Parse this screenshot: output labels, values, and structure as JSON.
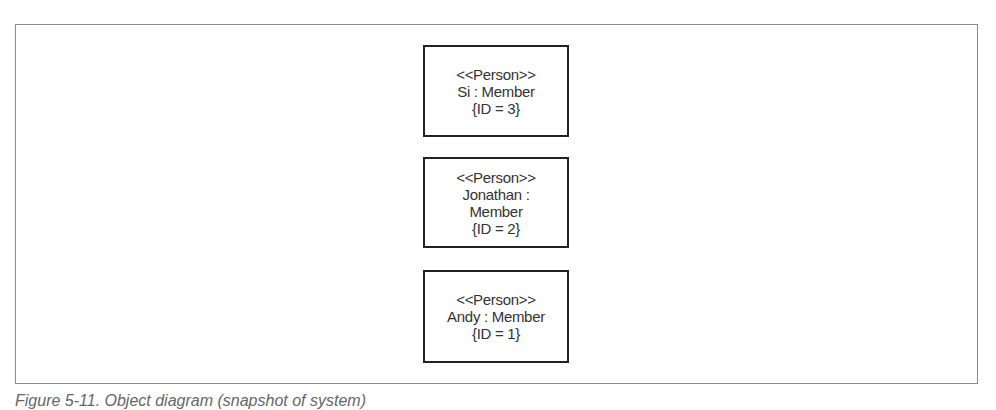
{
  "diagram": {
    "objects": [
      {
        "stereotype": "<<Person>>",
        "lines": [
          "Si : Member"
        ],
        "constraint": "{ID = 3}"
      },
      {
        "stereotype": "<<Person>>",
        "lines": [
          "Jonathan :",
          "Member"
        ],
        "constraint": "{ID = 2}"
      },
      {
        "stereotype": "<<Person>>",
        "lines": [
          "Andy : Member"
        ],
        "constraint": "{ID = 1}"
      }
    ]
  },
  "caption": "Figure 5-11. Object diagram (snapshot of system)"
}
